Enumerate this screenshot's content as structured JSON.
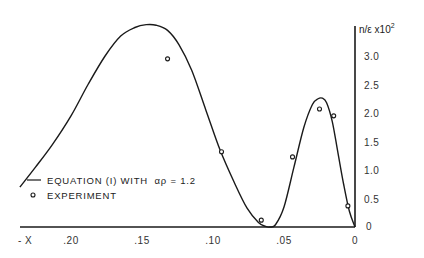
{
  "chart_data": {
    "type": "line",
    "title": "",
    "xlabel": "- X",
    "ylabel": "n/ε x10",
    "ylabel_exponent": "2",
    "xlim": [
      0.245,
      0
    ],
    "ylim": [
      0,
      3.75
    ],
    "x_inverted": true,
    "grid": false,
    "legend_position": "lower-left",
    "x_ticks": [
      {
        "value": 0.2,
        "label": ".20"
      },
      {
        "value": 0.15,
        "label": ".15"
      },
      {
        "value": 0.1,
        "label": ".10"
      },
      {
        "value": 0.05,
        "label": ".05"
      },
      {
        "value": 0.0,
        "label": "0"
      }
    ],
    "y_ticks": [
      {
        "value": 0.0,
        "label": "0"
      },
      {
        "value": 0.5,
        "label": "0.5"
      },
      {
        "value": 1.0,
        "label": "1.0"
      },
      {
        "value": 1.5,
        "label": "1.5"
      },
      {
        "value": 2.0,
        "label": "2.0"
      },
      {
        "value": 2.5,
        "label": "2.5"
      },
      {
        "value": 3.0,
        "label": "3.0"
      }
    ],
    "series": [
      {
        "name": "EQUATION (I) WITH αp = 1.2",
        "kind": "line",
        "color": "#1a1a1a",
        "x": [
          0.236,
          0.225,
          0.213,
          0.2,
          0.188,
          0.176,
          0.165,
          0.155,
          0.147,
          0.14,
          0.132,
          0.124,
          0.115,
          0.105,
          0.095,
          0.085,
          0.076,
          0.068,
          0.063,
          0.06,
          0.056,
          0.05,
          0.043,
          0.036,
          0.03,
          0.026,
          0.023,
          0.02,
          0.016,
          0.012,
          0.008,
          0.004,
          0.0
        ],
        "y": [
          0.7,
          1.05,
          1.45,
          1.95,
          2.5,
          3.0,
          3.35,
          3.5,
          3.55,
          3.54,
          3.45,
          3.2,
          2.75,
          2.05,
          1.35,
          0.78,
          0.33,
          0.08,
          0.01,
          0.0,
          0.04,
          0.35,
          1.05,
          1.75,
          2.15,
          2.25,
          2.26,
          2.18,
          1.85,
          1.3,
          0.75,
          0.28,
          0.0
        ]
      },
      {
        "name": "EXPERIMENT",
        "kind": "scatter",
        "marker": "open-circle",
        "color": "#1a1a1a",
        "x": [
          0.132,
          0.094,
          0.066,
          0.044,
          0.025,
          0.015,
          0.005
        ],
        "y": [
          2.95,
          1.32,
          0.12,
          1.23,
          2.07,
          1.95,
          0.37
        ]
      }
    ],
    "legend": [
      {
        "symbol": "line",
        "label": "EQUATION (I) WITH",
        "math": "αρ = 1.2"
      },
      {
        "symbol": "open-circle",
        "label": "EXPERIMENT"
      }
    ]
  }
}
